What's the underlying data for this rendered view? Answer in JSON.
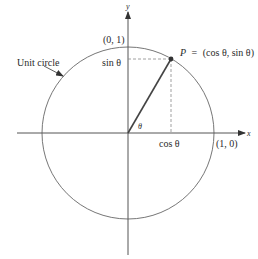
{
  "diagram": {
    "axes": {
      "x_label": "x",
      "y_label": "y"
    },
    "circle_label": "Unit circle",
    "point_top": "(0, 1)",
    "point_right": "(1, 0)",
    "point_p": {
      "name": "P",
      "equals": "=",
      "coords": "(cos θ, sin θ)"
    },
    "sin_label": "sin θ",
    "cos_label": "cos θ",
    "angle_label": "θ",
    "colors": {
      "line": "#555555",
      "radius": "#444444",
      "dashed": "#888888",
      "text": "#2a2a2a"
    }
  }
}
